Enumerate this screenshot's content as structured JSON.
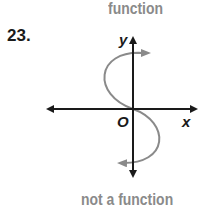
{
  "problem_number": "23.",
  "annotation_top": "function",
  "annotation_bottom": "not a function",
  "graph": {
    "x_axis_label": "x",
    "y_axis_label": "y",
    "origin_label": "O",
    "axis_color": "#1a1a1a",
    "curve_color": "#8a8a8a",
    "annotation_color": "#8a8a8a",
    "curve_description": "S-shaped curve through origin, arrow at top pointing right and arrow at bottom pointing left"
  }
}
